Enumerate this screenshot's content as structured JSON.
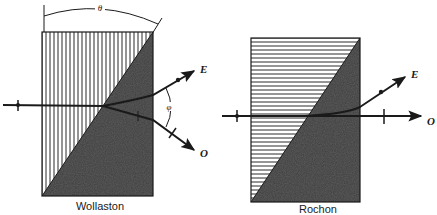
{
  "figure": {
    "type": "diagram",
    "background": "#ffffff",
    "ink_color": "#1a1a1a",
    "dark_region_color": "#3a3a3a",
    "hatch_color": "#2a2a2a"
  },
  "wollaston": {
    "caption": "Wollaston",
    "hatch_direction": "vertical",
    "angle_top_label": "θ",
    "angle_between_beams_label": "φ",
    "beams": {
      "extraordinary_label": "E",
      "ordinary_label": "O"
    }
  },
  "rochon": {
    "caption": "Rochon",
    "hatch_direction": "horizontal",
    "beams": {
      "extraordinary_label": "E",
      "ordinary_label": "O"
    }
  }
}
